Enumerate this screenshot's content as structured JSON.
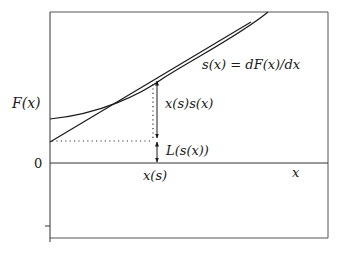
{
  "diagram": {
    "labels": {
      "y_axis": "F(x)",
      "zero": "0",
      "x_axis": "x",
      "x_point": "x(s)",
      "slope_def": "s(x) = dF(x)/dx",
      "upper_segment": "x(s)s(x)",
      "lower_segment": "L(s(x))"
    },
    "colors": {
      "stroke": "#1a1a1a",
      "frame": "#555555",
      "background": "#ffffff"
    }
  }
}
